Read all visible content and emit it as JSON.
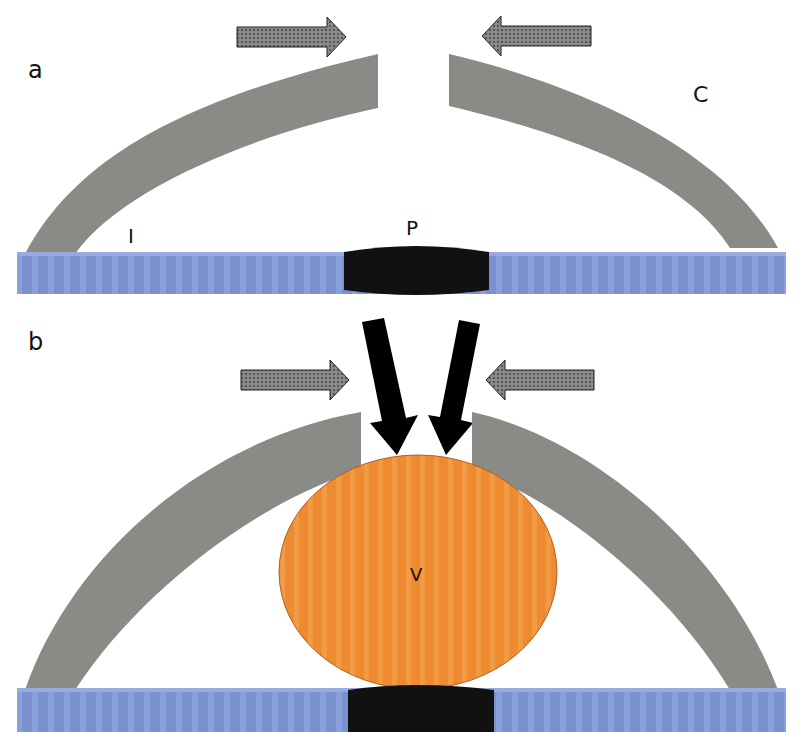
{
  "panels": [
    {
      "id": "a",
      "label": "a"
    },
    {
      "id": "b",
      "label": "b"
    }
  ],
  "labels": {
    "panel_a": "a",
    "panel_b": "b",
    "incisal": "I",
    "cervical": "C",
    "plate": "P",
    "vessel": "V"
  },
  "colors": {
    "base_band": "#7d93d0",
    "arm": "#8a8a86",
    "plate": "#111111",
    "vessel": "#ef8a2e",
    "force_arrow": "#6a6a6a",
    "black_arrow": "#000000"
  }
}
